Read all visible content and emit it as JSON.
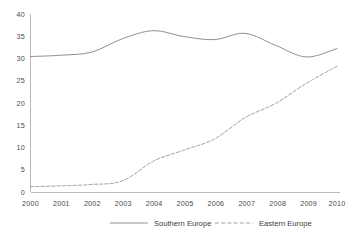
{
  "chart_data": {
    "type": "line",
    "title": "",
    "subtitle": "",
    "xlabel": "",
    "ylabel": "",
    "x": [
      2000,
      2001,
      2002,
      2003,
      2004,
      2005,
      2006,
      2007,
      2008,
      2009,
      2010
    ],
    "categories": [
      "2000",
      "2001",
      "2002",
      "2003",
      "2004",
      "2005",
      "2006",
      "2007",
      "2008",
      "2009",
      "2010"
    ],
    "series": [
      {
        "name": "Southern Europe",
        "style": "solid",
        "color": "#8a8a8a",
        "values": [
          30.5,
          30.8,
          31.5,
          34.5,
          36.3,
          35.0,
          34.3,
          35.7,
          33.0,
          30.4,
          32.3
        ]
      },
      {
        "name": "Eastern Europe",
        "style": "dashed",
        "color": "#9d9d9d",
        "values": [
          1.3,
          1.5,
          1.8,
          2.6,
          7.0,
          9.5,
          12.0,
          16.8,
          20.0,
          24.5,
          28.3
        ]
      }
    ],
    "ylim": [
      0,
      40
    ],
    "xlim": [
      2000,
      2010
    ],
    "yticks": [
      0,
      5,
      10,
      15,
      20,
      25,
      30,
      35,
      40
    ],
    "ytick_labels": [
      "0",
      "5",
      "10",
      "15",
      "20",
      "25",
      "30",
      "35",
      "40"
    ],
    "xtick_labels": [
      "2000",
      "2001",
      "2002",
      "2003",
      "2004",
      "2005",
      "2006",
      "2007",
      "2008",
      "2009",
      "2010"
    ],
    "grid": false,
    "legend_position": "bottom"
  },
  "legend": {
    "entries": [
      {
        "label": "Southern Europe",
        "style": "solid"
      },
      {
        "label": "Eastern Europe",
        "style": "dashed"
      }
    ]
  },
  "axes": {
    "y_axis_name": "value-axis",
    "x_axis_name": "year-axis"
  }
}
